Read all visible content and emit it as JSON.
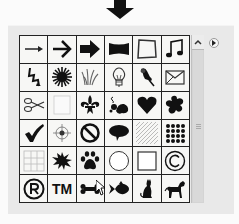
{
  "panel": {
    "title": "Custom Shape Picker",
    "flyout_icon": "flyout-menu-icon",
    "scroll_up_icon": "chevron-up-icon"
  },
  "indicator": {
    "icon": "down-arrow-icon"
  },
  "shapes": [
    {
      "name": "arrow-thin",
      "label": ""
    },
    {
      "name": "arrow-chevron",
      "label": ""
    },
    {
      "name": "arrow-bold",
      "label": ""
    },
    {
      "name": "banner",
      "label": ""
    },
    {
      "name": "frame",
      "label": ""
    },
    {
      "name": "music-note",
      "label": ""
    },
    {
      "name": "lightning",
      "label": ""
    },
    {
      "name": "starburst",
      "label": ""
    },
    {
      "name": "grass",
      "label": ""
    },
    {
      "name": "lightbulb",
      "label": ""
    },
    {
      "name": "pushpin",
      "label": ""
    },
    {
      "name": "envelope",
      "label": ""
    },
    {
      "name": "scissors",
      "label": ""
    },
    {
      "name": "blank-square",
      "label": ""
    },
    {
      "name": "fleur-de-lis",
      "label": ""
    },
    {
      "name": "ornament-flower",
      "label": ""
    },
    {
      "name": "heart",
      "label": ""
    },
    {
      "name": "puzzle-blob",
      "label": ""
    },
    {
      "name": "checkmark",
      "label": ""
    },
    {
      "name": "target",
      "label": ""
    },
    {
      "name": "no-sign",
      "label": ""
    },
    {
      "name": "speech-bubble",
      "label": ""
    },
    {
      "name": "diagonal-hatch",
      "label": ""
    },
    {
      "name": "dot-grid",
      "label": ""
    },
    {
      "name": "grid",
      "label": ""
    },
    {
      "name": "splat",
      "label": ""
    },
    {
      "name": "paw-print",
      "label": ""
    },
    {
      "name": "circle",
      "label": ""
    },
    {
      "name": "square",
      "label": ""
    },
    {
      "name": "copyright",
      "label": "©"
    },
    {
      "name": "registered",
      "label": "®"
    },
    {
      "name": "trademark",
      "label": "TM"
    },
    {
      "name": "bone",
      "label": ""
    },
    {
      "name": "fish",
      "label": ""
    },
    {
      "name": "cat",
      "label": ""
    },
    {
      "name": "dog",
      "label": ""
    }
  ],
  "selected_shape": "paw-print"
}
